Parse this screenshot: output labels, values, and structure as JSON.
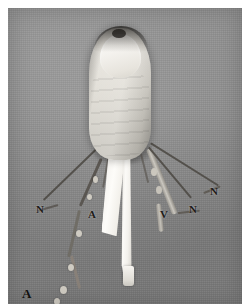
{
  "figure": {
    "panel_label": "A",
    "type": "grayscale anatomical photograph",
    "background_color": "#8e8e8e",
    "plate_border_color": "#ffffff"
  },
  "annotations": {
    "nerve_left": "N",
    "artery_left": "A",
    "vein_right": "V",
    "nerve_right_inner": "N",
    "nerve_right_outer": "N"
  },
  "legend": {
    "n_meaning": "N",
    "a_meaning": "A",
    "v_meaning": "V"
  },
  "structures": [
    {
      "name": "digit-body",
      "appearance": "pale soft tissue"
    },
    {
      "name": "nail-plate",
      "appearance": "bright white oval"
    },
    {
      "name": "tendon-flap",
      "appearance": "broad white band"
    },
    {
      "name": "tendon-strip",
      "appearance": "long white strip"
    }
  ]
}
